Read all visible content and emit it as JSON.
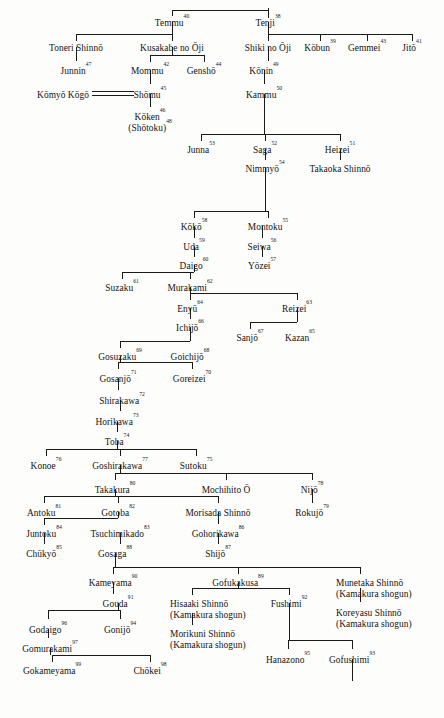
{
  "chart": {
    "type": "genealogy-tree",
    "background_color": "#fdfdfc",
    "line_color": "#1a1a1a",
    "text_color": "#141414"
  },
  "nodes": [
    {
      "id": "temmu",
      "name": "Temmu",
      "num": "40",
      "x": 172,
      "y": 18,
      "align": "ctr"
    },
    {
      "id": "tenji",
      "name": "Tenji",
      "num": "38",
      "x": 268,
      "y": 18,
      "align": "ctr"
    },
    {
      "id": "toneri",
      "name": "Toneri Shinnō",
      "num": "",
      "x": 76,
      "y": 43,
      "align": "ctr"
    },
    {
      "id": "kusakabe",
      "name": "Kusakabe no Ōji",
      "num": "",
      "x": 172,
      "y": 43,
      "align": "ctr"
    },
    {
      "id": "shiki",
      "name": "Shiki no Ōji",
      "num": "",
      "x": 268,
      "y": 43,
      "align": "ctr"
    },
    {
      "id": "kobun",
      "name": "Kōbun",
      "num": "39",
      "x": 320,
      "y": 43,
      "align": "ctr"
    },
    {
      "id": "gemmei",
      "name": "Gemmei",
      "num": "43",
      "x": 367,
      "y": 43,
      "align": "ctr"
    },
    {
      "id": "jito",
      "name": "Jitō",
      "num": "41",
      "x": 412,
      "y": 43,
      "align": "ctr"
    },
    {
      "id": "junnin",
      "name": "Junnin",
      "num": "47",
      "x": 76,
      "y": 66,
      "align": "ctr"
    },
    {
      "id": "mommu",
      "name": "Mommu",
      "num": "42",
      "x": 150,
      "y": 66,
      "align": "ctr"
    },
    {
      "id": "gensho",
      "name": "Genshō",
      "num": "44",
      "x": 204,
      "y": 66,
      "align": "ctr"
    },
    {
      "id": "konin",
      "name": "Kōnin",
      "num": "49",
      "x": 264,
      "y": 66,
      "align": "ctr"
    },
    {
      "id": "komyo",
      "name": "Kōmyō Kōgō",
      "num": "",
      "x": 63,
      "y": 90,
      "align": "ctr"
    },
    {
      "id": "shomu",
      "name": "Shōmu",
      "num": "45",
      "x": 150,
      "y": 90,
      "align": "ctr"
    },
    {
      "id": "kammu",
      "name": "Kammu",
      "num": "50",
      "x": 264,
      "y": 90,
      "align": "ctr"
    },
    {
      "id": "koken",
      "name": "Kōken",
      "num": "46",
      "x": 150,
      "y": 112,
      "align": "ctr",
      "second_line": "(Shōtoku)",
      "second_num": "48"
    },
    {
      "id": "junna",
      "name": "Junna",
      "num": "53",
      "x": 201,
      "y": 145,
      "align": "ctr"
    },
    {
      "id": "saga",
      "name": "Saga",
      "num": "52",
      "x": 265,
      "y": 145,
      "align": "ctr"
    },
    {
      "id": "heizei",
      "name": "Heizei",
      "num": "51",
      "x": 340,
      "y": 145,
      "align": "ctr"
    },
    {
      "id": "nimmyo",
      "name": "Nimmyō",
      "num": "54",
      "x": 265,
      "y": 164,
      "align": "ctr"
    },
    {
      "id": "takaoka",
      "name": "Takaoka Shinnō",
      "num": "",
      "x": 340,
      "y": 164,
      "align": "ctr"
    },
    {
      "id": "koko",
      "name": "Kōkō",
      "num": "58",
      "x": 194,
      "y": 222,
      "align": "ctr"
    },
    {
      "id": "montoku",
      "name": "Montoku",
      "num": "55",
      "x": 268,
      "y": 222,
      "align": "ctr"
    },
    {
      "id": "uda",
      "name": "Uda",
      "num": "59",
      "x": 194,
      "y": 242,
      "align": "ctr"
    },
    {
      "id": "seiwa",
      "name": "Seiwa",
      "num": "56",
      "x": 262,
      "y": 242,
      "align": "ctr"
    },
    {
      "id": "daigo",
      "name": "Daigo",
      "num": "60",
      "x": 194,
      "y": 261,
      "align": "ctr"
    },
    {
      "id": "yozei",
      "name": "Yōzei",
      "num": "57",
      "x": 262,
      "y": 261,
      "align": "ctr"
    },
    {
      "id": "suzaku",
      "name": "Suzaku",
      "num": "61",
      "x": 122,
      "y": 283,
      "align": "ctr"
    },
    {
      "id": "murakami",
      "name": "Murakami",
      "num": "62",
      "x": 190,
      "y": 283,
      "align": "ctr"
    },
    {
      "id": "enyu",
      "name": "Enyū",
      "num": "64",
      "x": 190,
      "y": 304,
      "align": "ctr"
    },
    {
      "id": "reizei",
      "name": "Reizei",
      "num": "63",
      "x": 297,
      "y": 304,
      "align": "ctr"
    },
    {
      "id": "ichijo",
      "name": "Ichijō",
      "num": "66",
      "x": 190,
      "y": 323,
      "align": "ctr"
    },
    {
      "id": "sanjo",
      "name": "Sanjō",
      "num": "67",
      "x": 250,
      "y": 333,
      "align": "ctr"
    },
    {
      "id": "kazan",
      "name": "Kazan",
      "num": "65",
      "x": 300,
      "y": 333,
      "align": "ctr"
    },
    {
      "id": "gosuzaku",
      "name": "Gosuzaku",
      "num": "69",
      "x": 120,
      "y": 352,
      "align": "ctr"
    },
    {
      "id": "goichijo",
      "name": "Goichijō",
      "num": "68",
      "x": 190,
      "y": 352,
      "align": "ctr"
    },
    {
      "id": "gosanjo",
      "name": "Gosanjō",
      "num": "71",
      "x": 118,
      "y": 374,
      "align": "ctr"
    },
    {
      "id": "goreizei",
      "name": "Goreizei",
      "num": "70",
      "x": 192,
      "y": 374,
      "align": "ctr"
    },
    {
      "id": "shirakawa",
      "name": "Shirakawa",
      "num": "72",
      "x": 122,
      "y": 396,
      "align": "ctr"
    },
    {
      "id": "horikawa",
      "name": "Horikawa",
      "num": "73",
      "x": 117,
      "y": 417,
      "align": "ctr"
    },
    {
      "id": "toba",
      "name": "Toba",
      "num": "74",
      "x": 117,
      "y": 437,
      "align": "ctr"
    },
    {
      "id": "konoe",
      "name": "Konoe",
      "num": "76",
      "x": 46,
      "y": 461,
      "align": "ctr"
    },
    {
      "id": "goshirakawa",
      "name": "Goshirakawa",
      "num": "77",
      "x": 120,
      "y": 461,
      "align": "ctr"
    },
    {
      "id": "sutoku",
      "name": "Sutoku",
      "num": "75",
      "x": 196,
      "y": 461,
      "align": "ctr"
    },
    {
      "id": "takakura",
      "name": "Takakura",
      "num": "80",
      "x": 115,
      "y": 485,
      "align": "ctr"
    },
    {
      "id": "mochihito",
      "name": "Mochihito Ō",
      "num": "",
      "x": 226,
      "y": 485,
      "align": "ctr"
    },
    {
      "id": "nijo",
      "name": "Nijō",
      "num": "78",
      "x": 312,
      "y": 485,
      "align": "ctr"
    },
    {
      "id": "antoku",
      "name": "Antoku",
      "num": "81",
      "x": 44,
      "y": 508,
      "align": "ctr"
    },
    {
      "id": "gotoba",
      "name": "Gotoba",
      "num": "82",
      "x": 118,
      "y": 508,
      "align": "ctr"
    },
    {
      "id": "morisada",
      "name": "Morisada Shinnō",
      "num": "",
      "x": 218,
      "y": 508,
      "align": "ctr"
    },
    {
      "id": "rokujo",
      "name": "Rokujō",
      "num": "79",
      "x": 312,
      "y": 508,
      "align": "ctr"
    },
    {
      "id": "juntoku",
      "name": "Juntoku",
      "num": "84",
      "x": 44,
      "y": 529,
      "align": "ctr"
    },
    {
      "id": "tsuchimikado",
      "name": "Tsuchimikado",
      "num": "83",
      "x": 120,
      "y": 529,
      "align": "ctr"
    },
    {
      "id": "gohorikawa",
      "name": "Gohorikawa",
      "num": "86",
      "x": 218,
      "y": 529,
      "align": "ctr"
    },
    {
      "id": "chukyo",
      "name": "Chūkyō",
      "num": "85",
      "x": 44,
      "y": 549,
      "align": "ctr"
    },
    {
      "id": "gosaga",
      "name": "Gosaga",
      "num": "88",
      "x": 115,
      "y": 549,
      "align": "ctr"
    },
    {
      "id": "shijo",
      "name": "Shijō",
      "num": "87",
      "x": 218,
      "y": 549,
      "align": "ctr"
    },
    {
      "id": "kameyama",
      "name": "Kameyama",
      "num": "90",
      "x": 113,
      "y": 578,
      "align": "ctr"
    },
    {
      "id": "gofukakusa",
      "name": "Gofukakusa",
      "num": "89",
      "x": 238,
      "y": 578,
      "align": "ctr"
    },
    {
      "id": "munetaka",
      "name": "Munetaka Shinnō",
      "num": "",
      "x": 336,
      "y": 578,
      "align": "lft",
      "second_line": "(Kamakura shogun)"
    },
    {
      "id": "gouda",
      "name": "Gouda",
      "num": "91",
      "x": 118,
      "y": 599,
      "align": "ctr"
    },
    {
      "id": "hisaaki",
      "name": "Hisaaki Shinnō",
      "num": "",
      "x": 170,
      "y": 599,
      "align": "lft",
      "second_line": "(Kamakura shogun)"
    },
    {
      "id": "fushimi",
      "name": "Fushimi",
      "num": "92",
      "x": 289,
      "y": 599,
      "align": "ctr"
    },
    {
      "id": "koreyasu",
      "name": "Koreyasu Shinnō",
      "num": "",
      "x": 336,
      "y": 608,
      "align": "lft",
      "second_line": "(Kamakura shogun)"
    },
    {
      "id": "godaigo",
      "name": "Godaigo",
      "num": "96",
      "x": 48,
      "y": 625,
      "align": "ctr"
    },
    {
      "id": "gonijo",
      "name": "Gonijō",
      "num": "94",
      "x": 120,
      "y": 625,
      "align": "ctr"
    },
    {
      "id": "morikuni",
      "name": "Morikuni Shinnō",
      "num": "",
      "x": 170,
      "y": 629,
      "align": "lft",
      "second_line": "(Kamakura shogun)"
    },
    {
      "id": "gomurakami",
      "name": "Gomurakami",
      "num": "97",
      "x": 50,
      "y": 644,
      "align": "ctr"
    },
    {
      "id": "hanazono",
      "name": "Hanazono",
      "num": "95",
      "x": 288,
      "y": 655,
      "align": "ctr"
    },
    {
      "id": "gofushimi",
      "name": "Gofushimi",
      "num": "93",
      "x": 352,
      "y": 655,
      "align": "ctr"
    },
    {
      "id": "gokameyama",
      "name": "Gokameyama",
      "num": "99",
      "x": 52,
      "y": 666,
      "align": "ctr"
    },
    {
      "id": "chokei",
      "name": "Chōkei",
      "num": "98",
      "x": 150,
      "y": 666,
      "align": "ctr"
    }
  ],
  "lines": [
    {
      "kind": "v",
      "x": 268,
      "y": 8,
      "len": 10
    },
    {
      "kind": "h",
      "x": 172,
      "y": 10,
      "len": 96
    },
    {
      "kind": "v",
      "x": 172,
      "y": 10,
      "len": 6
    },
    {
      "kind": "v",
      "x": 172,
      "y": 22,
      "len": 12
    },
    {
      "kind": "h",
      "x": 76,
      "y": 34,
      "len": 96
    },
    {
      "kind": "v",
      "x": 76,
      "y": 34,
      "len": 7
    },
    {
      "kind": "v",
      "x": 172,
      "y": 34,
      "len": 7
    },
    {
      "kind": "v",
      "x": 268,
      "y": 22,
      "len": 12
    },
    {
      "kind": "h",
      "x": 268,
      "y": 34,
      "len": 144
    },
    {
      "kind": "v",
      "x": 268,
      "y": 34,
      "len": 7
    },
    {
      "kind": "v",
      "x": 320,
      "y": 34,
      "len": 7
    },
    {
      "kind": "v",
      "x": 367,
      "y": 34,
      "len": 7
    },
    {
      "kind": "v",
      "x": 412,
      "y": 34,
      "len": 7
    },
    {
      "kind": "v",
      "x": 76,
      "y": 47,
      "len": 14
    },
    {
      "kind": "v",
      "x": 172,
      "y": 47,
      "len": 8
    },
    {
      "kind": "h",
      "x": 150,
      "y": 55,
      "len": 54
    },
    {
      "kind": "v",
      "x": 150,
      "y": 55,
      "len": 7
    },
    {
      "kind": "v",
      "x": 204,
      "y": 55,
      "len": 7
    },
    {
      "kind": "v",
      "x": 268,
      "y": 47,
      "len": 14
    },
    {
      "kind": "v",
      "x": 150,
      "y": 70,
      "len": 14
    },
    {
      "kind": "v",
      "x": 264,
      "y": 70,
      "len": 14
    },
    {
      "kind": "v",
      "x": 150,
      "y": 94,
      "len": 13
    },
    {
      "kind": "v",
      "x": 264,
      "y": 94,
      "len": 40
    },
    {
      "kind": "h",
      "x": 201,
      "y": 134,
      "len": 139
    },
    {
      "kind": "v",
      "x": 201,
      "y": 134,
      "len": 7
    },
    {
      "kind": "v",
      "x": 265,
      "y": 134,
      "len": 7
    },
    {
      "kind": "v",
      "x": 340,
      "y": 134,
      "len": 7
    },
    {
      "kind": "v",
      "x": 265,
      "y": 149,
      "len": 11
    },
    {
      "kind": "v",
      "x": 340,
      "y": 149,
      "len": 11
    },
    {
      "kind": "v",
      "x": 265,
      "y": 168,
      "len": 43
    },
    {
      "kind": "h",
      "x": 194,
      "y": 211,
      "len": 74
    },
    {
      "kind": "v",
      "x": 194,
      "y": 211,
      "len": 7
    },
    {
      "kind": "v",
      "x": 268,
      "y": 211,
      "len": 7
    },
    {
      "kind": "v",
      "x": 194,
      "y": 226,
      "len": 12
    },
    {
      "kind": "v",
      "x": 262,
      "y": 226,
      "len": 12
    },
    {
      "kind": "v",
      "x": 194,
      "y": 246,
      "len": 11
    },
    {
      "kind": "v",
      "x": 262,
      "y": 246,
      "len": 11
    },
    {
      "kind": "v",
      "x": 194,
      "y": 265,
      "len": 7
    },
    {
      "kind": "h",
      "x": 122,
      "y": 272,
      "len": 72
    },
    {
      "kind": "v",
      "x": 122,
      "y": 272,
      "len": 7
    },
    {
      "kind": "v",
      "x": 190,
      "y": 272,
      "len": 7
    },
    {
      "kind": "v",
      "x": 190,
      "y": 287,
      "len": 6
    },
    {
      "kind": "h",
      "x": 190,
      "y": 293,
      "len": 107
    },
    {
      "kind": "v",
      "x": 190,
      "y": 293,
      "len": 7
    },
    {
      "kind": "v",
      "x": 297,
      "y": 293,
      "len": 7
    },
    {
      "kind": "v",
      "x": 190,
      "y": 308,
      "len": 11
    },
    {
      "kind": "v",
      "x": 297,
      "y": 308,
      "len": 6
    },
    {
      "kind": "h",
      "x": 250,
      "y": 322,
      "len": 47
    },
    {
      "kind": "v",
      "x": 250,
      "y": 322,
      "len": 7
    },
    {
      "kind": "v",
      "x": 297,
      "y": 314,
      "len": 8
    },
    {
      "kind": "v",
      "x": 190,
      "y": 327,
      "len": 7
    },
    {
      "kind": "h",
      "x": 120,
      "y": 341,
      "len": 70
    },
    {
      "kind": "v",
      "x": 120,
      "y": 341,
      "len": 7
    },
    {
      "kind": "v",
      "x": 190,
      "y": 334,
      "len": 7
    },
    {
      "kind": "v",
      "x": 120,
      "y": 356,
      "len": 6
    },
    {
      "kind": "h",
      "x": 118,
      "y": 362,
      "len": 74
    },
    {
      "kind": "v",
      "x": 118,
      "y": 362,
      "len": 7
    },
    {
      "kind": "v",
      "x": 192,
      "y": 362,
      "len": 7
    },
    {
      "kind": "v",
      "x": 118,
      "y": 378,
      "len": 12
    },
    {
      "kind": "v",
      "x": 120,
      "y": 400,
      "len": 11
    },
    {
      "kind": "v",
      "x": 117,
      "y": 421,
      "len": 11
    },
    {
      "kind": "v",
      "x": 117,
      "y": 441,
      "len": 8
    },
    {
      "kind": "h",
      "x": 46,
      "y": 449,
      "len": 150
    },
    {
      "kind": "v",
      "x": 46,
      "y": 449,
      "len": 7
    },
    {
      "kind": "v",
      "x": 120,
      "y": 449,
      "len": 7
    },
    {
      "kind": "v",
      "x": 196,
      "y": 449,
      "len": 7
    },
    {
      "kind": "v",
      "x": 120,
      "y": 465,
      "len": 8
    },
    {
      "kind": "h",
      "x": 115,
      "y": 473,
      "len": 197
    },
    {
      "kind": "v",
      "x": 115,
      "y": 473,
      "len": 7
    },
    {
      "kind": "v",
      "x": 226,
      "y": 473,
      "len": 7
    },
    {
      "kind": "v",
      "x": 312,
      "y": 473,
      "len": 7
    },
    {
      "kind": "v",
      "x": 115,
      "y": 489,
      "len": 7
    },
    {
      "kind": "h",
      "x": 44,
      "y": 496,
      "len": 174
    },
    {
      "kind": "v",
      "x": 44,
      "y": 496,
      "len": 7
    },
    {
      "kind": "v",
      "x": 118,
      "y": 496,
      "len": 7
    },
    {
      "kind": "v",
      "x": 218,
      "y": 496,
      "len": 7
    },
    {
      "kind": "v",
      "x": 312,
      "y": 489,
      "len": 14
    },
    {
      "kind": "v",
      "x": 118,
      "y": 512,
      "len": 6
    },
    {
      "kind": "h",
      "x": 44,
      "y": 518,
      "len": 74
    },
    {
      "kind": "v",
      "x": 44,
      "y": 518,
      "len": 7
    },
    {
      "kind": "v",
      "x": 218,
      "y": 512,
      "len": 12
    },
    {
      "kind": "v",
      "x": 44,
      "y": 533,
      "len": 11
    },
    {
      "kind": "v",
      "x": 120,
      "y": 533,
      "len": 11
    },
    {
      "kind": "v",
      "x": 218,
      "y": 533,
      "len": 11
    },
    {
      "kind": "v",
      "x": 115,
      "y": 553,
      "len": 14
    },
    {
      "kind": "h",
      "x": 113,
      "y": 567,
      "len": 247
    },
    {
      "kind": "v",
      "x": 113,
      "y": 567,
      "len": 7
    },
    {
      "kind": "v",
      "x": 238,
      "y": 567,
      "len": 7
    },
    {
      "kind": "v",
      "x": 360,
      "y": 567,
      "len": 7
    },
    {
      "kind": "v",
      "x": 113,
      "y": 582,
      "len": 12
    },
    {
      "kind": "v",
      "x": 238,
      "y": 582,
      "len": 6
    },
    {
      "kind": "h",
      "x": 192,
      "y": 588,
      "len": 97
    },
    {
      "kind": "v",
      "x": 192,
      "y": 588,
      "len": 7
    },
    {
      "kind": "v",
      "x": 289,
      "y": 588,
      "len": 7
    },
    {
      "kind": "v",
      "x": 360,
      "y": 588,
      "len": 14
    },
    {
      "kind": "v",
      "x": 118,
      "y": 603,
      "len": 7
    },
    {
      "kind": "h",
      "x": 48,
      "y": 610,
      "len": 72
    },
    {
      "kind": "v",
      "x": 48,
      "y": 610,
      "len": 9
    },
    {
      "kind": "v",
      "x": 120,
      "y": 610,
      "len": 9
    },
    {
      "kind": "v",
      "x": 192,
      "y": 613,
      "len": 12
    },
    {
      "kind": "v",
      "x": 289,
      "y": 603,
      "len": 37
    },
    {
      "kind": "h",
      "x": 288,
      "y": 640,
      "len": 64
    },
    {
      "kind": "v",
      "x": 288,
      "y": 640,
      "len": 9
    },
    {
      "kind": "v",
      "x": 352,
      "y": 640,
      "len": 9
    },
    {
      "kind": "v",
      "x": 352,
      "y": 659,
      "len": 22
    },
    {
      "kind": "v",
      "x": 48,
      "y": 629,
      "len": 9
    },
    {
      "kind": "v",
      "x": 50,
      "y": 648,
      "len": 7
    },
    {
      "kind": "h",
      "x": 52,
      "y": 655,
      "len": 98
    },
    {
      "kind": "v",
      "x": 52,
      "y": 655,
      "len": 7
    },
    {
      "kind": "v",
      "x": 150,
      "y": 655,
      "len": 7
    }
  ],
  "marriages": [
    {
      "id": "komyo-shomu",
      "x": 92,
      "y": 91,
      "width": 42
    }
  ]
}
